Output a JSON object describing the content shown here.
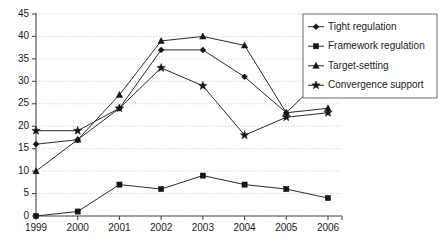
{
  "chart_data": {
    "type": "line",
    "title": "",
    "subtitle": "",
    "xlabel": "",
    "ylabel": "",
    "grid": true,
    "legend_position": "top-right",
    "categories": [
      "1999",
      "2000",
      "2001",
      "2002",
      "2003",
      "2004",
      "2005",
      "2006"
    ],
    "x": [
      1999,
      2000,
      2001,
      2002,
      2003,
      2004,
      2005,
      2006
    ],
    "xlim": [
      1999,
      2006
    ],
    "ylim": [
      0,
      45
    ],
    "yticks": [
      0,
      5,
      10,
      15,
      20,
      25,
      30,
      35,
      40,
      45
    ],
    "ytick_labels": [
      "0",
      "5",
      "10",
      "15",
      "20",
      "25",
      "30",
      "35",
      "40",
      "45"
    ],
    "series": [
      {
        "name": "Tight regulation",
        "marker": "diamond",
        "color": "#2b2b2b",
        "values": [
          16,
          17,
          24,
          37,
          37,
          31,
          23,
          32
        ]
      },
      {
        "name": "Framework regulation",
        "marker": "square",
        "color": "#2b2b2b",
        "values": [
          0,
          1,
          7,
          6,
          9,
          7,
          6,
          4
        ]
      },
      {
        "name": "Target-setting",
        "marker": "triangle",
        "color": "#2b2b2b",
        "values": [
          10,
          17,
          27,
          39,
          40,
          38,
          23,
          24
        ]
      },
      {
        "name": "Convergence support",
        "marker": "star",
        "color": "#2b2b2b",
        "values": [
          19,
          19,
          24,
          33,
          29,
          18,
          22,
          23
        ]
      }
    ]
  },
  "legend": {
    "items": [
      {
        "label": "Tight regulation",
        "marker": "diamond"
      },
      {
        "label": "Framework regulation",
        "marker": "square"
      },
      {
        "label": "Target-setting",
        "marker": "triangle"
      },
      {
        "label": "Convergence support",
        "marker": "star"
      }
    ]
  }
}
